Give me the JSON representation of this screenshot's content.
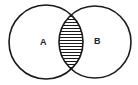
{
  "diagram": {
    "type": "venn",
    "sets": [
      {
        "label": "A",
        "cx": 46,
        "cy": 42,
        "r": 37
      },
      {
        "label": "B",
        "cx": 95,
        "cy": 42,
        "r": 36
      }
    ],
    "shaded_region": "A ∩ B",
    "shading": "horizontal-hatch",
    "stroke_color": "#1a1a1a",
    "background": "#ffffff"
  }
}
